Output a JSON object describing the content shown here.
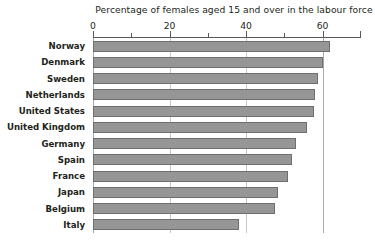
{
  "chart_data": {
    "type": "bar",
    "orientation": "horizontal",
    "title": "Percentage of females aged 15 and over in the labour force",
    "xlabel": "",
    "ylabel": "",
    "xlim": [
      0,
      70
    ],
    "xticks": [
      0,
      20,
      40,
      60
    ],
    "xtick_labels": [
      "0",
      "20",
      "40",
      "60"
    ],
    "minor_xticks": [
      10,
      30,
      50
    ],
    "grid": true,
    "legend": "none",
    "bar_color": "#969696",
    "bar_border_color": "#6d6e71",
    "categories": [
      "Norway",
      "Denmark",
      "Sweden",
      "Netherlands",
      "United States",
      "United Kingdom",
      "Germany",
      "Spain",
      "France",
      "Japan",
      "Belgium",
      "Italy"
    ],
    "values": [
      62,
      60,
      58.7,
      58,
      57.8,
      55.9,
      53.1,
      52,
      51,
      48.3,
      47.7,
      38.2
    ]
  }
}
